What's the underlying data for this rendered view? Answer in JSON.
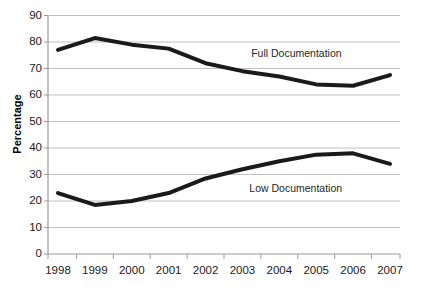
{
  "chart_data": {
    "type": "line",
    "title": "",
    "xlabel": "",
    "ylabel": "Percentage",
    "categories": [
      "1998",
      "1999",
      "2000",
      "2001",
      "2002",
      "2003",
      "2004",
      "2005",
      "2006",
      "2007"
    ],
    "x": [
      1998,
      1999,
      2000,
      2001,
      2002,
      2003,
      2004,
      2005,
      2006,
      2007
    ],
    "ylim": [
      0,
      90
    ],
    "ytick_values": [
      0,
      10,
      20,
      30,
      40,
      50,
      60,
      70,
      80,
      90
    ],
    "ytick_labels": [
      "0",
      "10",
      "20",
      "30",
      "40",
      "50",
      "60",
      "70",
      "80",
      "90"
    ],
    "grid": true,
    "grid_axis": "y",
    "legend_position": "inline-annotations",
    "line_color": "#1a1a1a",
    "line_width": 4,
    "grid_color": "#bfbfbf",
    "axis_color": "#9a9a9a",
    "series": [
      {
        "name": "Full Documentation",
        "values": [
          77,
          81.5,
          79,
          77.5,
          72,
          69,
          67,
          64,
          63.5,
          67.5
        ],
        "label_x": 2004.05,
        "label_y": 75.5
      },
      {
        "name": "Low Documentation",
        "values": [
          23,
          18.5,
          20,
          23,
          28.5,
          32,
          35,
          37.5,
          38,
          34
        ],
        "label_x": 2004.0,
        "label_y": 24.5
      }
    ],
    "annotations": [
      {
        "text": "Full Documentation",
        "series": "Full Documentation"
      },
      {
        "text": "Low Documentation",
        "series": "Low Documentation"
      }
    ]
  }
}
